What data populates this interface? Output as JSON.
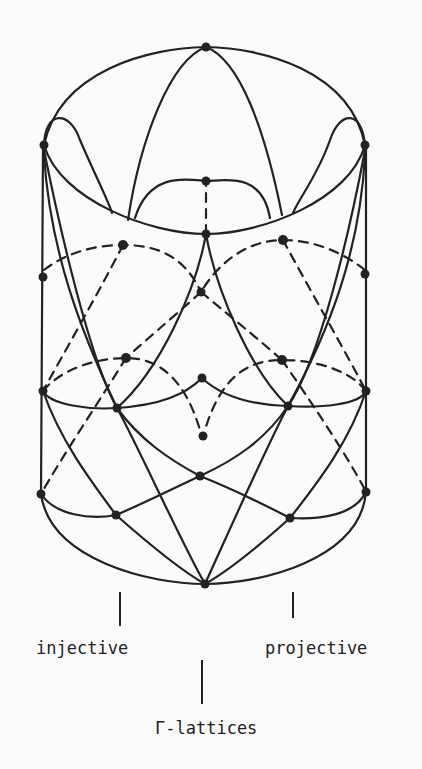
{
  "diagram": {
    "labels": {
      "left": "injective",
      "right": "projective",
      "bottom": "Γ-lattices"
    },
    "colors": {
      "ink": "#222222",
      "background": "#fbfbfb"
    }
  }
}
